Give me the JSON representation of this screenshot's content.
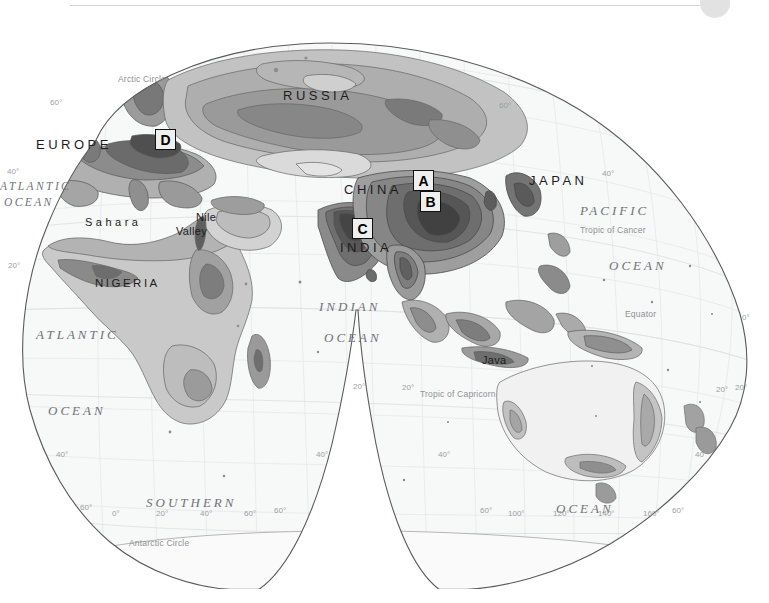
{
  "figure": {
    "kind": "world-population-density-map",
    "projection": "interrupted-homolosine-eastern-hemisphere",
    "top_rule_color": "#d6d6d6",
    "disc_color": "#e2e2e2",
    "ocean_text_color": "#6f7377",
    "land_outline_color": "#5a5a5a",
    "sea_fill": "#f7f8f8"
  },
  "markers": [
    {
      "label": "A",
      "x": 413,
      "y": 156
    },
    {
      "label": "B",
      "x": 420,
      "y": 177
    },
    {
      "label": "C",
      "x": 352,
      "y": 204
    },
    {
      "label": "D",
      "x": 155,
      "y": 115
    }
  ],
  "countries": [
    {
      "name": "RUSSIA",
      "x": 283,
      "y": 74,
      "size": "lg"
    },
    {
      "name": "EUROPE",
      "x": 36,
      "y": 123,
      "size": "lg"
    },
    {
      "name": "CHINA",
      "x": 344,
      "y": 168,
      "size": "lg"
    },
    {
      "name": "JAPAN",
      "x": 529,
      "y": 159,
      "size": "lg"
    },
    {
      "name": "INDIA",
      "x": 340,
      "y": 226,
      "size": "lg"
    },
    {
      "name": "NIGERIA",
      "x": 95,
      "y": 263,
      "size": "sm"
    }
  ],
  "places": [
    {
      "name": "Sahara",
      "x": 85,
      "y": 202,
      "spaced": true
    },
    {
      "name": "Nile",
      "x": 196,
      "y": 197,
      "spaced": false
    },
    {
      "name": "Valley",
      "x": 176,
      "y": 211,
      "spaced": false
    },
    {
      "name": "Java",
      "x": 482,
      "y": 340,
      "spaced": false
    }
  ],
  "oceans": [
    {
      "name": "ATLANTIC",
      "x": 0,
      "y": 166,
      "size": "sm"
    },
    {
      "name": "OCEAN",
      "x": 4,
      "y": 182,
      "size": "sm"
    },
    {
      "name": "ATLANTIC",
      "x": 36,
      "y": 313,
      "size": "lg"
    },
    {
      "name": "OCEAN",
      "x": 48,
      "y": 389,
      "size": "lg"
    },
    {
      "name": "INDIAN",
      "x": 319,
      "y": 285,
      "size": "lg"
    },
    {
      "name": "OCEAN",
      "x": 324,
      "y": 316,
      "size": "lg"
    },
    {
      "name": "PACIFIC",
      "x": 580,
      "y": 189,
      "size": "lg"
    },
    {
      "name": "OCEAN",
      "x": 609,
      "y": 244,
      "size": "lg"
    },
    {
      "name": "SOUTHERN",
      "x": 146,
      "y": 481,
      "size": "lg"
    },
    {
      "name": "OCEAN",
      "x": 556,
      "y": 487,
      "size": "lg"
    }
  ],
  "annotations": [
    {
      "text": "Arctic Circle",
      "x": 118,
      "y": 60
    },
    {
      "text": "Tropic of Cancer",
      "x": 580,
      "y": 211
    },
    {
      "text": "Equator",
      "x": 625,
      "y": 295
    },
    {
      "text": "Tropic of Capricorn",
      "x": 420,
      "y": 375
    },
    {
      "text": "Antarctic Circle",
      "x": 129,
      "y": 524
    }
  ],
  "graticule_ticks": [
    {
      "text": "60°",
      "x": 50,
      "y": 84
    },
    {
      "text": "60°",
      "x": 499,
      "y": 87
    },
    {
      "text": "40°",
      "x": 7,
      "y": 153
    },
    {
      "text": "40°",
      "x": 602,
      "y": 155
    },
    {
      "text": "20°",
      "x": 8,
      "y": 247
    },
    {
      "text": "20°",
      "x": 735,
      "y": 369
    },
    {
      "text": "0°",
      "x": 742,
      "y": 299
    },
    {
      "text": "20°",
      "x": 353,
      "y": 368
    },
    {
      "text": "20°",
      "x": 402,
      "y": 369
    },
    {
      "text": "20°",
      "x": 716,
      "y": 371
    },
    {
      "text": "40°",
      "x": 56,
      "y": 436
    },
    {
      "text": "40°",
      "x": 316,
      "y": 436
    },
    {
      "text": "40°",
      "x": 438,
      "y": 436
    },
    {
      "text": "40°",
      "x": 695,
      "y": 436
    },
    {
      "text": "60°",
      "x": 80,
      "y": 489
    },
    {
      "text": "0°",
      "x": 112,
      "y": 495
    },
    {
      "text": "20°",
      "x": 156,
      "y": 495
    },
    {
      "text": "40°",
      "x": 200,
      "y": 495
    },
    {
      "text": "60°",
      "x": 244,
      "y": 495
    },
    {
      "text": "60°",
      "x": 274,
      "y": 492
    },
    {
      "text": "60°",
      "x": 480,
      "y": 492
    },
    {
      "text": "100°",
      "x": 508,
      "y": 495
    },
    {
      "text": "120°",
      "x": 553,
      "y": 495
    },
    {
      "text": "140°",
      "x": 598,
      "y": 495
    },
    {
      "text": "160°",
      "x": 643,
      "y": 495
    },
    {
      "text": "60°",
      "x": 672,
      "y": 492
    }
  ]
}
